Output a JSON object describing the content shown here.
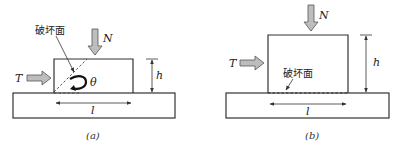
{
  "figure": {
    "panels": [
      {
        "id": "a",
        "caption": "(a)",
        "failure_surface_label": "破坏面",
        "force_vertical_label": "N",
        "force_horizontal_label": "T",
        "height_label": "h",
        "length_label": "l",
        "angle_label": "θ",
        "failure_surface_type": "inclined"
      },
      {
        "id": "b",
        "caption": "(b)",
        "failure_surface_label": "破坏面",
        "force_vertical_label": "N",
        "force_horizontal_label": "T",
        "height_label": "h",
        "length_label": "l",
        "failure_surface_type": "horizontal"
      }
    ]
  }
}
